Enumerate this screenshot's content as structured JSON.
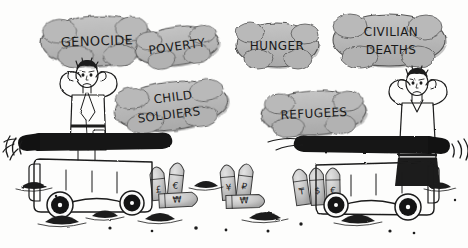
{
  "artwork": {
    "title": "Artillery of Atrocities",
    "medium": "hand-drawn editorial cartoon, grayscale ink and wash",
    "background_color": "#fdfdfc",
    "ink_color": "#1b1b1b",
    "bubble_fill": "#b7b7b7",
    "bubble_stroke": "#4a4a4a",
    "vehicle_fill": "#fbfbfa",
    "barrel_color": "#121212",
    "missile_fill": "#c9c9c9",
    "debris_color": "#1d1d1d"
  },
  "word_bubbles": [
    {
      "id": "genocide",
      "label": "GENOCIDE",
      "lines": [
        "GENOCIDE"
      ],
      "cx": 97,
      "cy": 41,
      "rx": 56,
      "ry": 25,
      "rotate": -2,
      "font_size": 13
    },
    {
      "id": "poverty",
      "label": "POVERTY",
      "lines": [
        "POVERTY"
      ],
      "cx": 177,
      "cy": 46,
      "rx": 42,
      "ry": 19,
      "rotate": -8,
      "font_size": 12
    },
    {
      "id": "hunger",
      "label": "HUNGER",
      "lines": [
        "HUNGER"
      ],
      "cx": 277,
      "cy": 45,
      "rx": 41,
      "ry": 22,
      "rotate": 0,
      "font_size": 12
    },
    {
      "id": "civilian-deaths",
      "label": "CIVILIAN DEATHS",
      "lines": [
        "CIVILIAN",
        "DEATHS"
      ],
      "cx": 389,
      "cy": 40,
      "rx": 56,
      "ry": 26,
      "rotate": 0,
      "font_size": 12
    },
    {
      "id": "child-soldiers",
      "label": "CHILD SOLDIERS",
      "lines": [
        "CHILD",
        "SOLDIERS"
      ],
      "cx": 171,
      "cy": 106,
      "rx": 57,
      "ry": 24,
      "rotate": -7,
      "font_size": 12
    },
    {
      "id": "refugees",
      "label": "REFUGEES",
      "lines": [
        "REFUGEES"
      ],
      "cx": 314,
      "cy": 113,
      "rx": 52,
      "ry": 22,
      "rotate": -3,
      "font_size": 12
    }
  ],
  "figures": [
    {
      "id": "left-civilian",
      "description": "distressed man in long coat covering his ears with both hands",
      "pose": "hands-over-ears",
      "x": 88,
      "y": 110
    },
    {
      "id": "right-civilian",
      "description": "distressed man in shirt and dark trousers covering his ears with both hands",
      "pose": "hands-over-ears",
      "x": 417,
      "y": 118
    }
  ],
  "artillery": [
    {
      "id": "left-cannon",
      "description": "wheeled field cannon firing toward the left",
      "facing": "left",
      "sound_waves": 3
    },
    {
      "id": "right-cannon",
      "description": "wheeled field cannon firing toward the right",
      "facing": "right",
      "sound_waves": 3
    }
  ],
  "munitions": [
    {
      "id": "shell-pound",
      "currency": "£",
      "orientation": "upright",
      "x": 158,
      "y": 184
    },
    {
      "id": "shell-euro",
      "currency": "€",
      "orientation": "upright",
      "x": 176,
      "y": 180
    },
    {
      "id": "shell-won-a",
      "currency": "₩",
      "orientation": "horizontal",
      "x": 176,
      "y": 199
    },
    {
      "id": "shell-yen",
      "currency": "¥",
      "orientation": "upright",
      "x": 228,
      "y": 182
    },
    {
      "id": "shell-ruble",
      "currency": "₽",
      "orientation": "upright",
      "x": 245,
      "y": 181
    },
    {
      "id": "shell-won-b",
      "currency": "₩",
      "orientation": "horizontal",
      "x": 243,
      "y": 201
    },
    {
      "id": "shell-tenge",
      "currency": "₸",
      "orientation": "upright",
      "x": 301,
      "y": 186
    },
    {
      "id": "shell-dollar",
      "currency": "$",
      "orientation": "upright",
      "x": 317,
      "y": 185
    },
    {
      "id": "shell-euro-2",
      "currency": "€",
      "orientation": "upright",
      "x": 333,
      "y": 185
    }
  ],
  "ground_debris": [
    {
      "id": "debris-1",
      "cx": 62,
      "cy": 222,
      "rx": 17,
      "ry": 7
    },
    {
      "id": "debris-2",
      "cx": 105,
      "cy": 215,
      "rx": 13,
      "ry": 6
    },
    {
      "id": "debris-3",
      "cx": 160,
      "cy": 219,
      "rx": 15,
      "ry": 7
    },
    {
      "id": "debris-4",
      "cx": 206,
      "cy": 185,
      "rx": 12,
      "ry": 6
    },
    {
      "id": "debris-5",
      "cx": 265,
      "cy": 218,
      "rx": 16,
      "ry": 7
    },
    {
      "id": "debris-6",
      "cx": 358,
      "cy": 220,
      "rx": 17,
      "ry": 8
    },
    {
      "id": "debris-7",
      "cx": 440,
      "cy": 186,
      "rx": 11,
      "ry": 5
    },
    {
      "id": "debris-8",
      "cx": 33,
      "cy": 186,
      "rx": 13,
      "ry": 6
    }
  ]
}
